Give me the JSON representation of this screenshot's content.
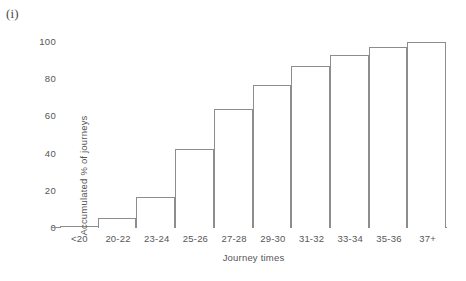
{
  "figure": {
    "panel_label": "(i)",
    "background_color": "#ffffff",
    "bar_outline_color": "#8d8d8d",
    "bar_fill_color": "#ffffff",
    "text_color": "#565656"
  },
  "chart_data": {
    "type": "bar",
    "title": "",
    "subtitle": "",
    "xlabel": "Journey times",
    "ylabel": "Accumulated % of journeys",
    "categories": [
      "<20",
      "20-22",
      "23-24",
      "25-26",
      "27-28",
      "29-30",
      "31-32",
      "33-34",
      "35-36",
      "37+"
    ],
    "values": [
      1,
      5.5,
      16.5,
      42.5,
      64,
      77,
      87,
      93,
      97.5,
      100
    ],
    "series": [
      {
        "name": "Accumulated % of journeys",
        "values": [
          1,
          5.5,
          16.5,
          42.5,
          64,
          77,
          87,
          93,
          97.5,
          100
        ]
      }
    ],
    "ylim": [
      0,
      100
    ],
    "yticks": [
      0,
      20,
      40,
      60,
      80,
      100
    ],
    "ytick_labels": [
      "0",
      "20",
      "40",
      "60",
      "80",
      "100"
    ],
    "xtick_labels": [
      "<20",
      "20-22",
      "23-24",
      "25-26",
      "27-28",
      "29-30",
      "31-32",
      "33-34",
      "35-36",
      "37+"
    ],
    "grid": false,
    "legend": false,
    "legend_position": "none",
    "bar_gap": 0,
    "annotations": [
      "(i)"
    ]
  }
}
